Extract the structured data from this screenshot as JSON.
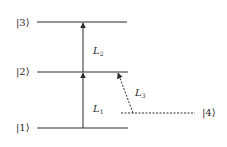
{
  "diagram": {
    "type": "energy-level-diagram",
    "levels": [
      {
        "id": "level-1",
        "label": "|1⟩",
        "y": 128,
        "x1": 37,
        "x2": 128,
        "style": "solid"
      },
      {
        "id": "level-2",
        "label": "|2⟩",
        "y": 72,
        "x1": 37,
        "x2": 128,
        "style": "solid"
      },
      {
        "id": "level-3",
        "label": "|3⟩",
        "y": 22,
        "x1": 37,
        "x2": 127,
        "style": "solid"
      },
      {
        "id": "level-4",
        "label": "|4⟩",
        "y": 113,
        "x1": 121,
        "x2": 195,
        "style": "dashed"
      }
    ],
    "transitions": [
      {
        "id": "L1",
        "label_base": "L",
        "label_sub": "1",
        "from": "level-1",
        "to": "level-2",
        "style": "solid"
      },
      {
        "id": "L2",
        "label_base": "L",
        "label_sub": "2",
        "from": "level-2",
        "to": "level-3",
        "style": "solid"
      },
      {
        "id": "L3",
        "label_base": "L",
        "label_sub": "3",
        "from": "level-4",
        "to": "level-2",
        "style": "dashed"
      }
    ],
    "colors": {
      "line": "#2a2a2a",
      "background": "#ffffff"
    }
  }
}
